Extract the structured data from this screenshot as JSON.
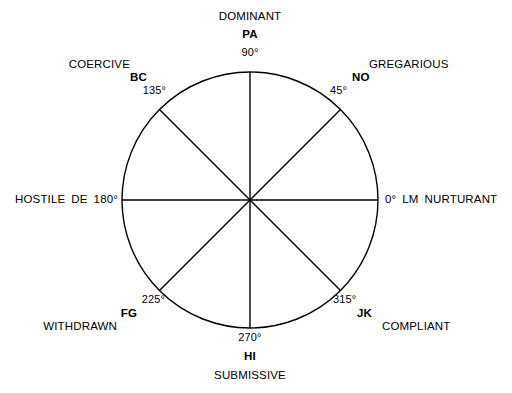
{
  "figure": {
    "name": "interpersonal-circumplex",
    "geometry": {
      "center_x": 250,
      "center_y": 200,
      "radius": 128,
      "stroke_color": "#000000",
      "stroke_width": 1.4,
      "background": "#ffffff"
    },
    "axes": [
      {
        "id": "horizontal",
        "from_deg": 0,
        "to_deg": 180
      },
      {
        "id": "vertical",
        "from_deg": 90,
        "to_deg": 270
      },
      {
        "id": "diagonal-a",
        "from_deg": 45,
        "to_deg": 225
      },
      {
        "id": "diagonal-b",
        "from_deg": 135,
        "to_deg": 315
      }
    ],
    "octants": [
      {
        "code": "PA",
        "degrees": "90°",
        "trait": "DOMINANT",
        "angle": 90
      },
      {
        "code": "NO",
        "degrees": "45°",
        "trait": "GREGARIOUS",
        "angle": 45
      },
      {
        "code": "LM",
        "degrees": "0°",
        "trait": "NURTURANT",
        "angle": 0
      },
      {
        "code": "JK",
        "degrees": "315°",
        "trait": "COMPLIANT",
        "angle": 315
      },
      {
        "code": "HI",
        "degrees": "270°",
        "trait": "SUBMISSIVE",
        "angle": 270
      },
      {
        "code": "FG",
        "degrees": "225°",
        "trait": "WITHDRAWN",
        "angle": 225
      },
      {
        "code": "DE",
        "degrees": "180°",
        "trait": "HOSTILE",
        "angle": 180
      },
      {
        "code": "BC",
        "degrees": "135°",
        "trait": "COERCIVE",
        "angle": 135
      }
    ]
  }
}
